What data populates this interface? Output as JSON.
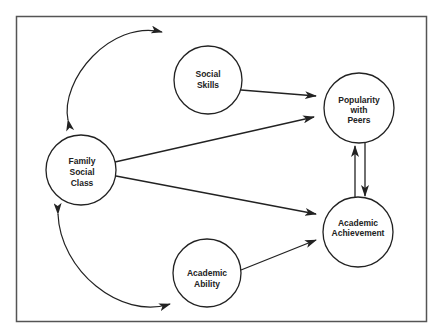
{
  "diagram": {
    "type": "path-diagram",
    "frame": {
      "x": 16,
      "y": 16,
      "width": 411,
      "height": 306,
      "stroke": "#555555"
    },
    "colors": {
      "stroke": "#222222",
      "background": "#ffffff",
      "text": "#222222"
    },
    "nodes": [
      {
        "id": "social_skills",
        "lines": [
          "Social",
          "Skills"
        ],
        "cx": 208,
        "cy": 80,
        "r": 34
      },
      {
        "id": "popularity",
        "lines": [
          "Popularity",
          "with",
          "Peers"
        ],
        "cx": 359,
        "cy": 108,
        "r": 35
      },
      {
        "id": "family_class",
        "lines": [
          "Family",
          "Social",
          "Class"
        ],
        "cx": 81,
        "cy": 170,
        "r": 35
      },
      {
        "id": "achievement",
        "lines": [
          "Academic",
          "Achievement"
        ],
        "cx": 358,
        "cy": 232,
        "r": 35
      },
      {
        "id": "ability",
        "lines": [
          "Academic",
          "Ability"
        ],
        "cx": 207,
        "cy": 273,
        "r": 34
      }
    ],
    "edges": [
      {
        "from": "social_skills",
        "to": "popularity",
        "kind": "directed"
      },
      {
        "from": "family_class",
        "to": "popularity",
        "kind": "directed"
      },
      {
        "from": "family_class",
        "to": "achievement",
        "kind": "directed"
      },
      {
        "from": "ability",
        "to": "achievement",
        "kind": "directed"
      },
      {
        "from": "popularity",
        "to": "achievement",
        "kind": "directed"
      },
      {
        "from": "achievement",
        "to": "popularity",
        "kind": "directed"
      },
      {
        "from": "family_class",
        "to": "social_skills",
        "kind": "curved-bidirectional"
      },
      {
        "from": "family_class",
        "to": "ability",
        "kind": "curved-bidirectional"
      }
    ]
  },
  "labels": {
    "social_skills": [
      "Social",
      "Skills"
    ],
    "popularity": [
      "Popularity",
      "with",
      "Peers"
    ],
    "family_class": [
      "Family",
      "Social",
      "Class"
    ],
    "achievement": [
      "Academic",
      "Achievement"
    ],
    "ability": [
      "Academic",
      "Ability"
    ]
  }
}
